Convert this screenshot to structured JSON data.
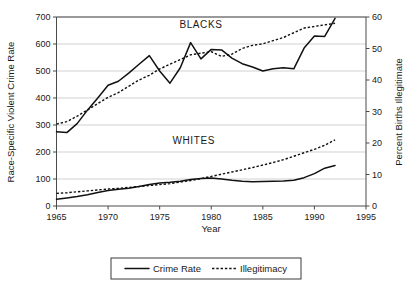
{
  "chart_data": {
    "type": "line",
    "title": "",
    "xlabel": "Year",
    "ylabel": "Race-Specific Violent Crime Rate",
    "y2label": "Percent Births Illegitimate",
    "xlim": [
      1965,
      1995
    ],
    "ylim": [
      0,
      700
    ],
    "y2lim": [
      0,
      60
    ],
    "xticks": [
      "1965",
      "1970",
      "1975",
      "1980",
      "1985",
      "1990",
      "1995"
    ],
    "xtick_values": [
      1965,
      1970,
      1975,
      1980,
      1985,
      1990,
      1995
    ],
    "yticks": [
      "0",
      "100",
      "200",
      "300",
      "400",
      "500",
      "600",
      "700"
    ],
    "ytick_values": [
      0,
      100,
      200,
      300,
      400,
      500,
      600,
      700
    ],
    "y2ticks": [
      "0",
      "10",
      "20",
      "30",
      "40",
      "50",
      "60"
    ],
    "y2tick_values": [
      0,
      10,
      20,
      30,
      40,
      50,
      60
    ],
    "grid": true,
    "grid_axis": "y",
    "legend_position": "bottom-outside",
    "annotations": [
      {
        "text": "BLACKS",
        "x": 1979.0,
        "y": 660,
        "axis": "left"
      },
      {
        "text": "WHITES",
        "x": 1978.3,
        "y": 228,
        "axis": "left"
      }
    ],
    "legend": [
      {
        "label": "Crime Rate",
        "style": "solid"
      },
      {
        "label": "Illegitimacy",
        "style": "dotted"
      }
    ],
    "x": [
      1965,
      1966,
      1967,
      1968,
      1969,
      1970,
      1971,
      1972,
      1973,
      1974,
      1975,
      1976,
      1977,
      1978,
      1979,
      1980,
      1981,
      1982,
      1983,
      1984,
      1985,
      1986,
      1987,
      1988,
      1989,
      1990,
      1991,
      1992
    ],
    "series": [
      {
        "name": "Blacks - Crime Rate",
        "group": "BLACKS",
        "style": "solid",
        "axis": "left",
        "values": [
          275,
          272,
          305,
          355,
          400,
          447,
          462,
          492,
          525,
          557,
          500,
          455,
          512,
          605,
          545,
          580,
          578,
          548,
          527,
          515,
          500,
          508,
          512,
          508,
          585,
          630,
          628,
          695
        ]
      },
      {
        "name": "Blacks - Illegitimacy",
        "group": "BLACKS",
        "style": "dotted",
        "axis": "right",
        "values": [
          26.0,
          26.8,
          28.5,
          30.5,
          32.5,
          34.5,
          36.0,
          38.0,
          40.0,
          41.5,
          43.5,
          45.0,
          46.5,
          48.0,
          48.5,
          49.0,
          47.5,
          48.2,
          50.0,
          51.0,
          51.5,
          52.5,
          53.5,
          55.0,
          56.5,
          57.0,
          57.5,
          58.0
        ]
      },
      {
        "name": "Whites - Crime Rate",
        "group": "WHITES",
        "style": "solid",
        "axis": "left",
        "values": [
          25,
          30,
          35,
          42,
          50,
          57,
          62,
          66,
          72,
          80,
          85,
          88,
          92,
          98,
          102,
          104,
          100,
          95,
          92,
          90,
          91,
          92,
          93,
          95,
          105,
          120,
          140,
          150
        ]
      },
      {
        "name": "Whites - Illegitimacy",
        "group": "WHITES",
        "style": "dotted",
        "axis": "right",
        "values": [
          4.0,
          4.2,
          4.5,
          4.8,
          5.1,
          5.4,
          5.6,
          5.9,
          6.2,
          6.5,
          6.8,
          7.1,
          7.6,
          8.1,
          8.7,
          9.4,
          10.1,
          10.8,
          11.5,
          12.2,
          13.0,
          13.8,
          14.7,
          15.8,
          16.9,
          18.0,
          19.3,
          21.0
        ]
      }
    ]
  },
  "colors": {
    "line": "#111111",
    "axis": "#4a4a4a",
    "grid": "#bdbdbd",
    "background": "#ffffff"
  }
}
